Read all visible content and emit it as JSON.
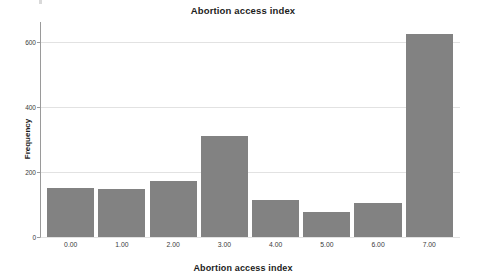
{
  "chart_data": {
    "type": "bar",
    "title": "Abortion access index",
    "xlabel": "Abortion access index",
    "ylabel": "Frequency",
    "categories": [
      "0.00",
      "1.00",
      "2.00",
      "3.00",
      "4.00",
      "5.00",
      "6.00",
      "7.00"
    ],
    "values": [
      149,
      146,
      173,
      311,
      113,
      77,
      103,
      622
    ],
    "ylim": [
      0,
      660
    ],
    "xlim": [
      -0.6,
      7.6
    ],
    "yticks": [
      0,
      200,
      400,
      600
    ],
    "ytick_labels": [
      "0",
      "200",
      "400",
      "600"
    ],
    "xtick_labels": [
      "0.00",
      "1.00",
      "2.00",
      "3.00",
      "4.00",
      "5.00",
      "6.00",
      "7.00"
    ],
    "grid": "horizontal",
    "legend": "none",
    "bar_color": "#828282",
    "gridline_color": "#e2e2e2",
    "axis_color": "#9a9a9a",
    "background": "#ffffff"
  }
}
